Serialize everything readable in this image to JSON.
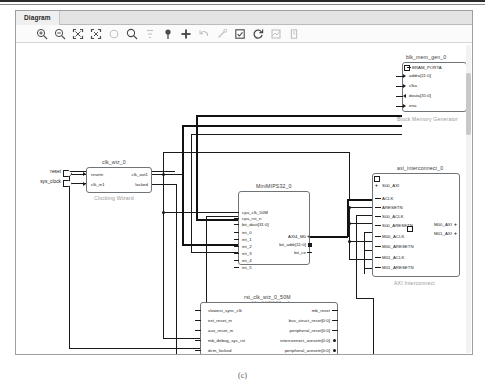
{
  "window": {
    "tab_label": "Diagram"
  },
  "toolbar": {
    "icons": [
      {
        "name": "zoom-in-icon",
        "glyph": "zoom-in",
        "x": 20,
        "enabled": true
      },
      {
        "name": "zoom-out-icon",
        "glyph": "zoom-out",
        "x": 38,
        "enabled": true
      },
      {
        "name": "zoom-fit-icon",
        "glyph": "fit",
        "x": 56,
        "enabled": true
      },
      {
        "name": "zoom-area-icon",
        "glyph": "area",
        "x": 74,
        "enabled": true
      },
      {
        "name": "zoom-reset-icon",
        "glyph": "circle",
        "x": 92,
        "enabled": false
      },
      {
        "name": "search-icon",
        "glyph": "search",
        "x": 110,
        "enabled": true
      },
      {
        "name": "hierarchy-icon",
        "glyph": "hier",
        "x": 128,
        "enabled": false
      },
      {
        "name": "pin-icon",
        "glyph": "pin",
        "x": 146,
        "enabled": true
      },
      {
        "name": "add-ip-icon",
        "glyph": "plus",
        "x": 164,
        "enabled": true
      },
      {
        "name": "undo-icon",
        "glyph": "undo",
        "x": 182,
        "enabled": false
      },
      {
        "name": "connect-icon",
        "glyph": "wand",
        "x": 200,
        "enabled": false
      },
      {
        "name": "validate-icon",
        "glyph": "check-box",
        "x": 218,
        "enabled": true
      },
      {
        "name": "refresh-icon",
        "glyph": "refresh",
        "x": 236,
        "enabled": true
      },
      {
        "name": "optimize-icon",
        "glyph": "optimize",
        "x": 254,
        "enabled": false
      },
      {
        "name": "settings-icon",
        "glyph": "settings",
        "x": 272,
        "enabled": false
      }
    ]
  },
  "external_ports": [
    {
      "name": "reset",
      "label": "reset"
    },
    {
      "name": "sys_clock",
      "label": "sys_clock"
    }
  ],
  "blocks": [
    {
      "id": "blk_mem_gen_0",
      "title": "blk_mem_gen_0",
      "caption": "Block Memory Generator",
      "inputs": [
        "BRAM_PORTA",
        "addra[11:0]",
        "clka",
        "douta[31:0]",
        "ena"
      ],
      "outputs": []
    },
    {
      "id": "clk_wiz_0",
      "title": "clk_wiz_0",
      "caption": "Clocking Wizard",
      "inputs": [
        "resetn",
        "clk_in1"
      ],
      "outputs": [
        "clk_out1",
        "locked"
      ]
    },
    {
      "id": "MiniMIPS32_0",
      "title": "MiniMIPS32_0",
      "caption": "MiniMIPS32_v1",
      "inputs": [
        "cpu_clk_50M",
        "cpu_rst_n",
        "bit_dout[31:0]",
        "int_0",
        "int_1",
        "int_2",
        "int_3",
        "int_4",
        "int_5"
      ],
      "outputs": [
        "AXI4_M0",
        "bit_addr[11:0]",
        "bit_ce"
      ]
    },
    {
      "id": "axi_interconnect_0",
      "title": "axi_interconnect_0",
      "caption": "AXI Interconnect",
      "inputs": [
        "S00_AXI",
        "ACLK",
        "ARESETN",
        "S00_ACLK",
        "S00_ARESETN",
        "M00_ACLK",
        "M00_ARESETN",
        "M01_ACLK",
        "M01_ARESETN"
      ],
      "outputs": [
        "M00_AXI",
        "M01_AXI"
      ]
    },
    {
      "id": "rst_clk_wiz_0_50M",
      "title": "rst_clk_wiz_0_50M",
      "caption": "Processor System Reset",
      "inputs": [
        "slowest_sync_clk",
        "ext_reset_in",
        "aux_reset_in",
        "mb_debug_sys_rst",
        "dcm_locked"
      ],
      "outputs": [
        "mb_reset",
        "bus_struct_reset[0:0]",
        "peripheral_reset[0:0]",
        "interconnect_aresetn[0:0]",
        "peripheral_aresetn[0:0]"
      ]
    }
  ],
  "figure": {
    "caption": "(c)"
  }
}
